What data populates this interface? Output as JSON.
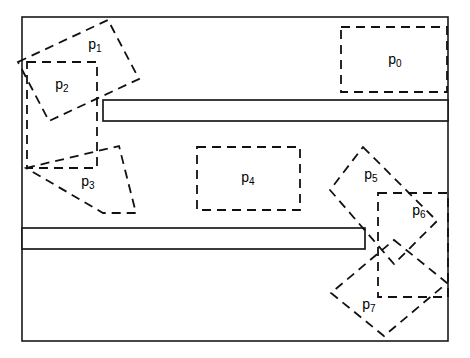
{
  "figure": {
    "width": 470,
    "height": 358,
    "background_color": "#ffffff",
    "line_color": "#111111",
    "frame_color": "#1a1a1a"
  },
  "frame": {
    "name": "outer-boundary",
    "x": 22,
    "y": 17,
    "width": 426,
    "height": 324,
    "style": "solid"
  },
  "corridors": [
    {
      "name": "upper-corridor-bar",
      "x": 103,
      "y": 100,
      "width": 345,
      "height": 21,
      "style": "solid"
    },
    {
      "name": "lower-corridor-bar",
      "x": 22,
      "y": 228,
      "width": 343,
      "height": 21,
      "style": "solid"
    }
  ],
  "shapes": [
    {
      "id": "p0",
      "label": "p",
      "subscript": "0",
      "kind": "rectangle",
      "rotation_deg": 0,
      "points": "341,27 447,27 447,92 341,92",
      "label_x": 395,
      "label_y": 60
    },
    {
      "id": "p1",
      "label": "p",
      "subscript": "1",
      "kind": "rectangle",
      "rotation_deg": -25,
      "points": "18,62 108,20 139,79 49,121",
      "label_x": 95,
      "label_y": 45
    },
    {
      "id": "p2",
      "label": "p",
      "subscript": "2",
      "kind": "rectangle",
      "rotation_deg": 0,
      "points": "27,62 97,62 97,168 27,168",
      "label_x": 62,
      "label_y": 85
    },
    {
      "id": "p3",
      "label": "p",
      "subscript": "3",
      "kind": "rectangle",
      "rotation_deg": 25,
      "points": "26,168 119,146 136,213 103,213",
      "label_x": 88,
      "label_y": 182
    },
    {
      "id": "p4",
      "label": "p",
      "subscript": "4",
      "kind": "rectangle",
      "rotation_deg": 0,
      "points": "197,147 300,147 300,210 197,210",
      "label_x": 248,
      "label_y": 178
    },
    {
      "id": "p5",
      "label": "p",
      "subscript": "5",
      "kind": "rectangle",
      "rotation_deg": -45,
      "points": "363,147 437,221 394,264 330,190",
      "label_x": 371,
      "label_y": 175
    },
    {
      "id": "p6",
      "label": "p",
      "subscript": "6",
      "kind": "rectangle",
      "rotation_deg": 0,
      "points": "378,193 448,193 448,297 378,297",
      "label_x": 419,
      "label_y": 211
    },
    {
      "id": "p7",
      "label": "p",
      "subscript": "7",
      "kind": "rectangle",
      "rotation_deg": 45,
      "points": "394,240 447,283 384,336 331,293",
      "label_x": 369,
      "label_y": 305
    }
  ],
  "style": {
    "dash_pattern": "9 6",
    "shape_stroke_width": 1.8,
    "frame_stroke_width": 1.6
  }
}
